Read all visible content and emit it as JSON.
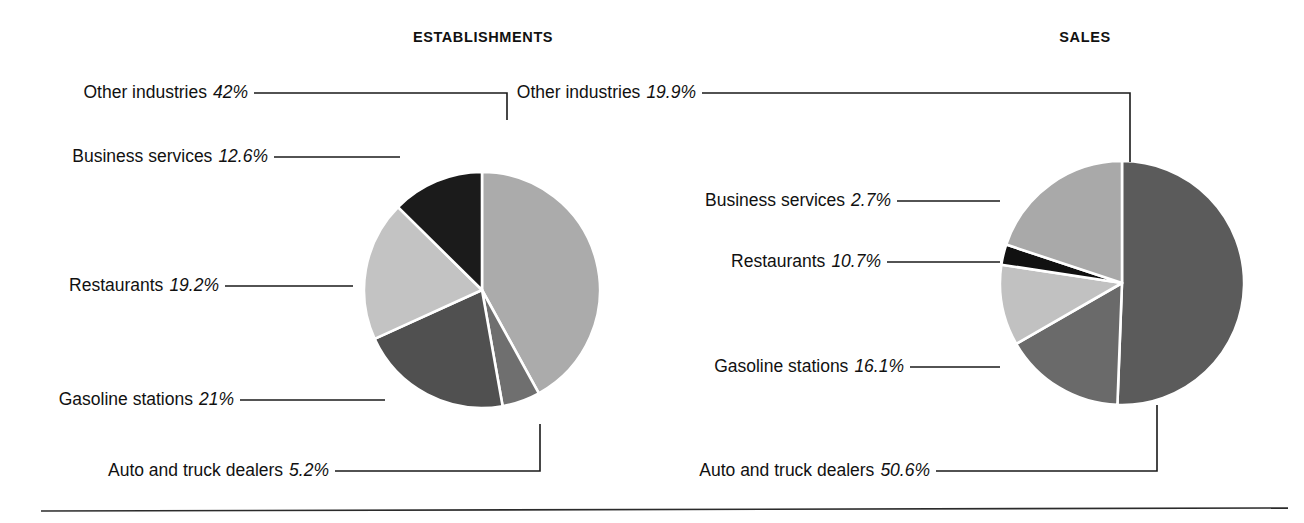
{
  "figure": {
    "background": "#ffffff",
    "text_color": "#111111",
    "separator_color": "#2b2b2b",
    "leader_color": "#1a1a1a",
    "slice_border_color": "#ffffff"
  },
  "panels": [
    {
      "key": "establishments",
      "title": "ESTABLISHMENTS",
      "center": {
        "x": 482,
        "y": 290
      },
      "radius": 118,
      "slices": [
        {
          "label": "Other industries",
          "value": 42.0,
          "display": "42%",
          "color": "#ababab"
        },
        {
          "label": "Auto and truck dealers",
          "value": 5.2,
          "display": "5.2%",
          "color": "#6f6f6f"
        },
        {
          "label": "Gasoline stations",
          "value": 21.0,
          "display": "21%",
          "color": "#505050"
        },
        {
          "label": "Restaurants",
          "value": 19.2,
          "display": "19.2%",
          "color": "#c3c3c3"
        },
        {
          "label": "Business services",
          "value": 12.6,
          "display": "12.6%",
          "color": "#1b1b1b"
        }
      ],
      "callouts": [
        {
          "label": "Other industries",
          "display": "42%",
          "text_right": 248,
          "text_baseline": 99,
          "path": "M 254 93 L 507 93 L 507 120"
        },
        {
          "label": "Business services",
          "display": "12.6%",
          "text_right": 268,
          "text_baseline": 163,
          "path": "M 274 157 L 400 157"
        },
        {
          "label": "Restaurants",
          "display": "19.2%",
          "text_right": 219,
          "text_baseline": 292,
          "path": "M 225 286 L 353 286"
        },
        {
          "label": "Gasoline stations",
          "display": "21%",
          "text_right": 234,
          "text_baseline": 406,
          "path": "M 240 400 L 385 400"
        },
        {
          "label": "Auto and truck dealers",
          "display": "5.2%",
          "text_right": 329,
          "text_baseline": 477,
          "path": "M 335 471 L 540 471 L 540 424"
        }
      ]
    },
    {
      "key": "sales",
      "title": "SALES",
      "center": {
        "x": 1122,
        "y": 283
      },
      "radius": 122,
      "slices": [
        {
          "label": "Auto and truck dealers",
          "value": 50.6,
          "display": "50.6%",
          "color": "#5b5b5b"
        },
        {
          "label": "Gasoline stations",
          "value": 16.1,
          "display": "16.1%",
          "color": "#6a6a6a"
        },
        {
          "label": "Restaurants",
          "value": 10.7,
          "display": "10.7%",
          "color": "#c1c1c1"
        },
        {
          "label": "Business services",
          "value": 2.7,
          "display": "2.7%",
          "color": "#111111"
        },
        {
          "label": "Other industries",
          "value": 19.9,
          "display": "19.9%",
          "color": "#a9a9a9"
        }
      ],
      "callouts": [
        {
          "label": "Other industries",
          "display": "19.9%",
          "text_right": 696,
          "text_baseline": 99,
          "path": "M 702 93 L 1130 93 L 1130 162"
        },
        {
          "label": "Business services",
          "display": "2.7%",
          "text_right": 891,
          "text_baseline": 207,
          "path": "M 897 201 L 1000 201"
        },
        {
          "label": "Restaurants",
          "display": "10.7%",
          "text_right": 881,
          "text_baseline": 268,
          "path": "M 887 262 L 1000 262"
        },
        {
          "label": "Gasoline stations",
          "display": "16.1%",
          "text_right": 904,
          "text_baseline": 373,
          "path": "M 910 367 L 1000 367"
        },
        {
          "label": "Auto and truck dealers",
          "display": "50.6%",
          "text_right": 930,
          "text_baseline": 477,
          "path": "M 936 471 L 1157 471 L 1157 405"
        }
      ]
    }
  ],
  "separator": {
    "x1": 41,
    "y1": 511,
    "x2": 1288,
    "y2": 508
  },
  "chart_data": [
    {
      "type": "pie",
      "title": "ESTABLISHMENTS",
      "categories": [
        "Other industries",
        "Auto and truck dealers",
        "Gasoline stations",
        "Restaurants",
        "Business services"
      ],
      "values": [
        42.0,
        5.2,
        21.0,
        19.2,
        12.6
      ],
      "value_labels": [
        "42%",
        "5.2%",
        "21%",
        "19.2%",
        "12.6%"
      ],
      "unit": "percent",
      "start_angle_deg": 0,
      "direction": "clockwise",
      "legend": "callout-labels-left",
      "colors": [
        "#ababab",
        "#6f6f6f",
        "#505050",
        "#c3c3c3",
        "#1b1b1b"
      ]
    },
    {
      "type": "pie",
      "title": "SALES",
      "categories": [
        "Auto and truck dealers",
        "Gasoline stations",
        "Restaurants",
        "Business services",
        "Other industries"
      ],
      "values": [
        50.6,
        16.1,
        10.7,
        2.7,
        19.9
      ],
      "value_labels": [
        "50.6%",
        "16.1%",
        "10.7%",
        "2.7%",
        "19.9%"
      ],
      "unit": "percent",
      "start_angle_deg": 0,
      "direction": "clockwise",
      "legend": "callout-labels-left",
      "colors": [
        "#5b5b5b",
        "#6a6a6a",
        "#c1c1c1",
        "#111111",
        "#a9a9a9"
      ]
    }
  ]
}
